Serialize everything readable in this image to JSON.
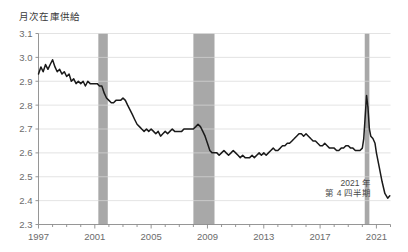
{
  "chart_data": {
    "type": "line",
    "title": "月次在庫供給",
    "xlabel": "",
    "ylabel": "",
    "ylim": [
      2.3,
      3.1
    ],
    "xlim": [
      1997.0,
      2022.0
    ],
    "grid": true,
    "legend": null,
    "y_ticks": [
      "3.1",
      "3.0",
      "2.9",
      "2.8",
      "2.7",
      "2.6",
      "2.5",
      "2.4",
      "2.3"
    ],
    "y_tick_values": [
      3.1,
      3.0,
      2.9,
      2.8,
      2.7,
      2.6,
      2.5,
      2.4,
      2.3
    ],
    "x_ticks": [
      "1997",
      "2001",
      "2005",
      "2009",
      "2013",
      "2017",
      "2021"
    ],
    "x_tick_values": [
      1997,
      2001,
      2005,
      2009,
      2013,
      2017,
      2021
    ],
    "annotations": [
      {
        "name": "last-point-label",
        "line1": "2021 年",
        "line2": "第 4 四半期",
        "x": 2020.6,
        "y": 2.46
      }
    ],
    "shaded_bands": [
      {
        "name": "recession-2001",
        "x0": 2001.25,
        "x1": 2001.92,
        "color": "#a8a8a8"
      },
      {
        "name": "recession-2008",
        "x0": 2008.0,
        "x1": 2009.5,
        "color": "#a8a8a8"
      },
      {
        "name": "recession-2020",
        "x0": 2020.17,
        "x1": 2020.5,
        "color": "#a8a8a8"
      }
    ],
    "series": [
      {
        "name": "月次在庫供給",
        "color": "#1a1a1a",
        "x": [
          1997.0,
          1997.17,
          1997.33,
          1997.5,
          1997.67,
          1997.83,
          1998.0,
          1998.17,
          1998.33,
          1998.5,
          1998.67,
          1998.83,
          1999.0,
          1999.17,
          1999.33,
          1999.5,
          1999.67,
          1999.83,
          2000.0,
          2000.17,
          2000.33,
          2000.5,
          2000.67,
          2000.83,
          2001.0,
          2001.17,
          2001.33,
          2001.5,
          2001.67,
          2001.83,
          2002.0,
          2002.17,
          2002.33,
          2002.5,
          2002.67,
          2002.83,
          2003.0,
          2003.17,
          2003.33,
          2003.5,
          2003.67,
          2003.83,
          2004.0,
          2004.17,
          2004.33,
          2004.5,
          2004.67,
          2004.83,
          2005.0,
          2005.17,
          2005.33,
          2005.5,
          2005.67,
          2005.83,
          2006.0,
          2006.17,
          2006.33,
          2006.5,
          2006.67,
          2006.83,
          2007.0,
          2007.17,
          2007.33,
          2007.5,
          2007.67,
          2007.83,
          2008.0,
          2008.17,
          2008.33,
          2008.5,
          2008.67,
          2008.83,
          2009.0,
          2009.17,
          2009.33,
          2009.5,
          2009.67,
          2009.83,
          2010.0,
          2010.17,
          2010.33,
          2010.5,
          2010.67,
          2010.83,
          2011.0,
          2011.17,
          2011.33,
          2011.5,
          2011.67,
          2011.83,
          2012.0,
          2012.17,
          2012.33,
          2012.5,
          2012.67,
          2012.83,
          2013.0,
          2013.17,
          2013.33,
          2013.5,
          2013.67,
          2013.83,
          2014.0,
          2014.17,
          2014.33,
          2014.5,
          2014.67,
          2014.83,
          2015.0,
          2015.17,
          2015.33,
          2015.5,
          2015.67,
          2015.83,
          2016.0,
          2016.17,
          2016.33,
          2016.5,
          2016.67,
          2016.83,
          2017.0,
          2017.17,
          2017.33,
          2017.5,
          2017.67,
          2017.83,
          2018.0,
          2018.17,
          2018.33,
          2018.5,
          2018.67,
          2018.83,
          2019.0,
          2019.17,
          2019.33,
          2019.5,
          2019.67,
          2019.83,
          2020.0,
          2020.1,
          2020.2,
          2020.3,
          2020.4,
          2020.5,
          2020.6,
          2020.75,
          2020.9,
          2021.0,
          2021.2,
          2021.4,
          2021.6,
          2021.8,
          2021.95
        ],
        "values": [
          2.93,
          2.96,
          2.94,
          2.97,
          2.95,
          2.97,
          2.99,
          2.96,
          2.94,
          2.95,
          2.93,
          2.94,
          2.92,
          2.93,
          2.9,
          2.91,
          2.89,
          2.9,
          2.89,
          2.9,
          2.88,
          2.9,
          2.89,
          2.89,
          2.89,
          2.89,
          2.88,
          2.88,
          2.85,
          2.83,
          2.82,
          2.81,
          2.81,
          2.82,
          2.82,
          2.82,
          2.83,
          2.82,
          2.8,
          2.78,
          2.76,
          2.74,
          2.72,
          2.71,
          2.7,
          2.69,
          2.7,
          2.69,
          2.7,
          2.69,
          2.68,
          2.69,
          2.67,
          2.68,
          2.69,
          2.68,
          2.69,
          2.7,
          2.69,
          2.69,
          2.69,
          2.69,
          2.7,
          2.7,
          2.7,
          2.7,
          2.7,
          2.71,
          2.72,
          2.71,
          2.69,
          2.67,
          2.64,
          2.61,
          2.6,
          2.6,
          2.6,
          2.59,
          2.6,
          2.61,
          2.6,
          2.59,
          2.6,
          2.61,
          2.6,
          2.59,
          2.58,
          2.59,
          2.58,
          2.58,
          2.58,
          2.59,
          2.58,
          2.59,
          2.6,
          2.59,
          2.6,
          2.59,
          2.6,
          2.61,
          2.62,
          2.61,
          2.61,
          2.62,
          2.63,
          2.63,
          2.64,
          2.64,
          2.65,
          2.66,
          2.67,
          2.68,
          2.68,
          2.67,
          2.68,
          2.67,
          2.66,
          2.65,
          2.65,
          2.64,
          2.63,
          2.63,
          2.64,
          2.63,
          2.62,
          2.62,
          2.62,
          2.61,
          2.61,
          2.62,
          2.62,
          2.63,
          2.63,
          2.62,
          2.62,
          2.61,
          2.61,
          2.61,
          2.62,
          2.66,
          2.75,
          2.84,
          2.79,
          2.7,
          2.67,
          2.66,
          2.64,
          2.6,
          2.54,
          2.48,
          2.43,
          2.41,
          2.42
        ]
      }
    ]
  }
}
